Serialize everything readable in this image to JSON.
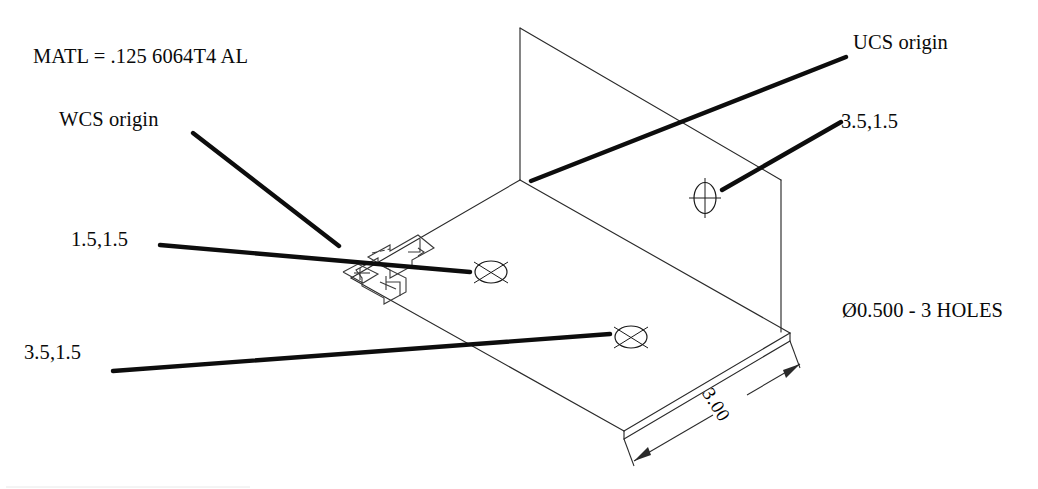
{
  "drawing": {
    "type": "isometric-mechanical-part-drawing",
    "notes": {
      "material": "MATL = .125 6064T4 AL",
      "hole_callout": "Ø0.500 - 3 HOLES"
    },
    "labels": {
      "wcs_origin": "WCS origin",
      "ucs_origin": "UCS origin",
      "hole_upper_right": "3.5,1.5",
      "hole_plate_near": "1.5,1.5",
      "hole_plate_far": "3.5,1.5"
    },
    "dimensions": [
      {
        "value": "3.00",
        "name": "plate-width-dimension"
      }
    ],
    "icons": {
      "ucs_icon": "ucs-axis-icon",
      "wcs_icon": "wcs-axis-icon",
      "hole_marker": "hole-center-mark"
    },
    "colors": {
      "line": "#1a1a1a",
      "leader": "#0d0d0d",
      "background": "#ffffff"
    }
  }
}
